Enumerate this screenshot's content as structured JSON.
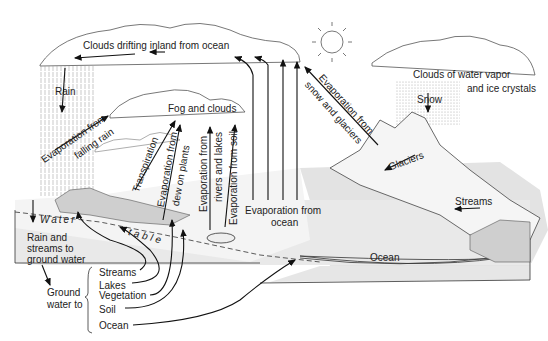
{
  "diagram": {
    "type": "water-cycle",
    "labels": {
      "clouds_drifting": "Clouds drifting inland from ocean",
      "rain": "Rain",
      "evap_falling_rain_1": "Evaporation from",
      "evap_falling_rain_2": "falling rain",
      "fog_clouds": "Fog and clouds",
      "transpiration": "Transpiration",
      "evap_dew_1": "Evaporation from",
      "evap_dew_2": "dew on plants",
      "evap_rivers_1": "Evaporation from",
      "evap_rivers_2": "rivers and lakes",
      "evap_soil": "Evaporation from soil",
      "evap_ocean_1": "Evaporation from",
      "evap_ocean_2": "ocean",
      "evap_snow_1": "Evaporation from",
      "evap_snow_2": "snow and glaciers",
      "clouds_vapor_1": "Clouds of water vapor",
      "clouds_vapor_2": "and ice crystals",
      "snow": "Snow",
      "glaciers": "Glaciers",
      "streams_right": "Streams",
      "water": "Water",
      "table": "table",
      "rain_streams_1": "Rain and",
      "rain_streams_2": "streams to",
      "rain_streams_3": "ground water",
      "ground_water_1": "Ground",
      "ground_water_2": "water to",
      "ocean_bottom": "Ocean"
    },
    "groundwater_destinations": [
      "Streams",
      "Lakes",
      "Vegetation",
      "Soil",
      "Ocean"
    ]
  }
}
